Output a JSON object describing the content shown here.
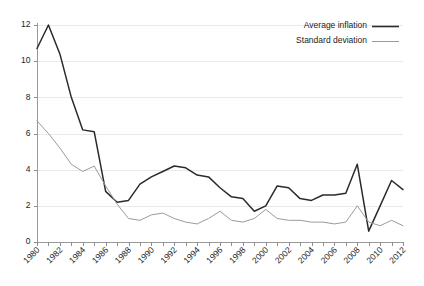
{
  "chart_data": {
    "type": "line",
    "title": "",
    "subtitle": "",
    "xlabel": "",
    "ylabel": "",
    "xlim": [
      1980,
      2012
    ],
    "ylim": [
      0,
      12
    ],
    "grid": true,
    "legend_position": "top-right",
    "x": [
      1980,
      1981,
      1982,
      1983,
      1984,
      1985,
      1986,
      1987,
      1988,
      1989,
      1990,
      1991,
      1992,
      1993,
      1994,
      1995,
      1996,
      1997,
      1998,
      1999,
      2000,
      2001,
      2002,
      2003,
      2004,
      2005,
      2006,
      2007,
      2008,
      2009,
      2010,
      2011,
      2012
    ],
    "xtick_labels": [
      "1980",
      "1982",
      "1984",
      "1986",
      "1988",
      "1990",
      "1992",
      "1994",
      "1996",
      "1998",
      "2000",
      "2002",
      "2004",
      "2006",
      "2008",
      "2010",
      "2012"
    ],
    "ytick_labels": [
      "0",
      "2",
      "4",
      "6",
      "8",
      "10",
      "12"
    ],
    "ytick_values": [
      0,
      2,
      4,
      6,
      8,
      10,
      12
    ],
    "series": [
      {
        "name": "Average inflation",
        "color": "#2b2b2b",
        "width": 1.5,
        "values": [
          10.7,
          12.0,
          10.4,
          8.0,
          6.2,
          6.1,
          2.8,
          2.2,
          2.3,
          3.2,
          3.6,
          3.9,
          4.2,
          4.1,
          3.7,
          3.6,
          3.0,
          2.5,
          2.4,
          1.7,
          2.0,
          3.1,
          3.0,
          2.4,
          2.3,
          2.6,
          2.6,
          2.7,
          4.3,
          0.6,
          2.0,
          3.4,
          2.9
        ]
      },
      {
        "name": "Standard deviation",
        "color": "#9b9b9b",
        "width": 1.0,
        "values": [
          6.7,
          6.0,
          5.2,
          4.3,
          3.9,
          4.2,
          3.1,
          2.1,
          1.3,
          1.2,
          1.5,
          1.6,
          1.3,
          1.1,
          1.0,
          1.3,
          1.7,
          1.2,
          1.1,
          1.3,
          1.8,
          1.3,
          1.2,
          1.2,
          1.1,
          1.1,
          1.0,
          1.1,
          2.0,
          1.1,
          0.9,
          1.2,
          0.9
        ]
      }
    ]
  },
  "legend": {
    "items": [
      {
        "label": "Average inflation"
      },
      {
        "label": "Standard deviation"
      }
    ]
  }
}
